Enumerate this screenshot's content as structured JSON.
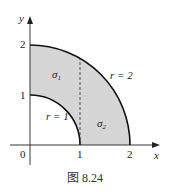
{
  "figure": {
    "caption": "图 8.24",
    "axes": {
      "x_label": "x",
      "y_label": "y",
      "origin_label": "0",
      "x_ticks": [
        "1",
        "2"
      ],
      "y_ticks": [
        "1",
        "2"
      ]
    },
    "curves": [
      {
        "label": "r = 1",
        "radius": 1
      },
      {
        "label": "r = 2",
        "radius": 2
      }
    ],
    "regions": [
      {
        "label": "σ1",
        "description": "annulus part with x from 0 to 1"
      },
      {
        "label": "σ2",
        "description": "annulus part with x from 1 to 2"
      }
    ],
    "divider": "dashed line x = 1",
    "colors": {
      "fill": "#d6d6d6",
      "stroke": "#111111"
    }
  }
}
